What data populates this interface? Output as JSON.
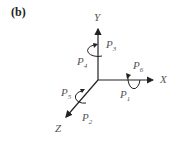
{
  "figure": {
    "panel_label": "(b)",
    "axes": {
      "x": {
        "label": "X"
      },
      "y": {
        "label": "Y"
      },
      "z": {
        "label": "Z"
      }
    },
    "rotations": [
      {
        "name": "P",
        "sub": "3",
        "axis": "Y",
        "position": "right"
      },
      {
        "name": "P",
        "sub": "4",
        "axis": "Y",
        "position": "left"
      },
      {
        "name": "P",
        "sub": "6",
        "axis": "X",
        "position": "above"
      },
      {
        "name": "P",
        "sub": "1",
        "axis": "X",
        "position": "below"
      },
      {
        "name": "P",
        "sub": "5",
        "axis": "Z",
        "position": "left"
      },
      {
        "name": "P",
        "sub": "2",
        "axis": "Z",
        "position": "below-right"
      }
    ],
    "colors": {
      "axis": "#222222",
      "text": "#555555"
    }
  }
}
